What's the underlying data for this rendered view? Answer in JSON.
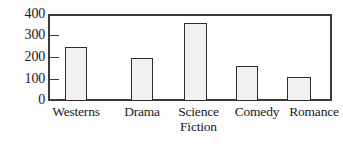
{
  "chart_data": {
    "type": "bar",
    "title": "",
    "subtitle": "",
    "xlabel": "",
    "ylabel": "",
    "categories": [
      "Westerns",
      "Drama",
      "Science\nFiction",
      "Comedy",
      "Romance"
    ],
    "values": [
      250,
      200,
      360,
      160,
      110
    ],
    "ylim": [
      0,
      400
    ],
    "yticks": [
      0,
      100,
      200,
      300,
      400
    ],
    "ytick_labels": [
      "0",
      "100",
      "200",
      "300",
      "400"
    ],
    "grid": false,
    "legend": false,
    "legend_position": "none",
    "bar_fill_color": "#f1f1f1",
    "bar_border_color": "#2e2e2e",
    "axis_color": "#3a3a3a",
    "background_color": "#fdfdfd"
  },
  "axis": {
    "ticks": [
      {
        "label": "400",
        "value": 400
      },
      {
        "label": "300",
        "value": 300
      },
      {
        "label": "200",
        "value": 200
      },
      {
        "label": "100",
        "value": 100
      },
      {
        "label": "0",
        "value": 0
      }
    ]
  },
  "bars": [
    {
      "label": "Westerns",
      "value": 250
    },
    {
      "label": "Drama",
      "value": 200
    },
    {
      "label": "Science\nFiction",
      "value": 360
    },
    {
      "label": "Comedy",
      "value": 160
    },
    {
      "label": "Romance",
      "value": 110
    }
  ]
}
